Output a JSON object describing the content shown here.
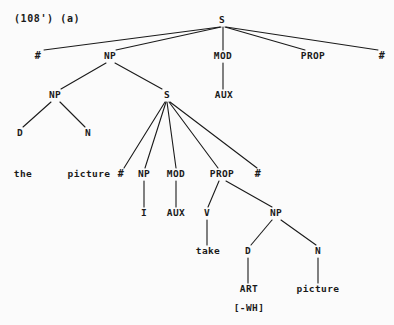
{
  "figure": {
    "caption": "(108') (a)",
    "caption_x": 14,
    "caption_y": 14,
    "background_color": "#fbfbfb",
    "ink_color": "#1a1a1a",
    "width": 394,
    "height": 325
  },
  "nodes": [
    {
      "id": "S0",
      "label": "S",
      "x": 222,
      "y": 20,
      "kind": "nonterminal"
    },
    {
      "id": "HASH_L",
      "label": "#",
      "x": 38,
      "y": 56,
      "kind": "boundary"
    },
    {
      "id": "NP1",
      "label": "NP",
      "x": 110,
      "y": 56,
      "kind": "nonterminal"
    },
    {
      "id": "MOD1",
      "label": "MOD",
      "x": 223,
      "y": 56,
      "kind": "nonterminal"
    },
    {
      "id": "PROP1",
      "label": "PROP",
      "x": 313,
      "y": 56,
      "kind": "nonterminal"
    },
    {
      "id": "HASH_R",
      "label": "#",
      "x": 382,
      "y": 56,
      "kind": "boundary"
    },
    {
      "id": "NP2",
      "label": "NP",
      "x": 55,
      "y": 95,
      "kind": "nonterminal"
    },
    {
      "id": "S1",
      "label": "S",
      "x": 167,
      "y": 95,
      "kind": "nonterminal"
    },
    {
      "id": "AUX1",
      "label": "AUX",
      "x": 224,
      "y": 95,
      "kind": "nonterminal"
    },
    {
      "id": "D1",
      "label": "D",
      "x": 20,
      "y": 133,
      "kind": "nonterminal"
    },
    {
      "id": "N1",
      "label": "N",
      "x": 88,
      "y": 133,
      "kind": "nonterminal"
    },
    {
      "id": "THE",
      "label": "the",
      "x": 23,
      "y": 174,
      "kind": "terminal"
    },
    {
      "id": "PICTURE1",
      "label": "picture",
      "x": 89,
      "y": 174,
      "kind": "terminal"
    },
    {
      "id": "HASH_L2",
      "label": "#",
      "x": 121,
      "y": 174,
      "kind": "boundary"
    },
    {
      "id": "NP3",
      "label": "NP",
      "x": 144,
      "y": 174,
      "kind": "nonterminal"
    },
    {
      "id": "MOD2",
      "label": "MOD",
      "x": 176,
      "y": 174,
      "kind": "nonterminal"
    },
    {
      "id": "PROP2",
      "label": "PROP",
      "x": 222,
      "y": 174,
      "kind": "nonterminal"
    },
    {
      "id": "HASH_R2",
      "label": "#",
      "x": 258,
      "y": 174,
      "kind": "boundary"
    },
    {
      "id": "I1",
      "label": "I",
      "x": 144,
      "y": 213,
      "kind": "nonterminal"
    },
    {
      "id": "AUX2",
      "label": "AUX",
      "x": 176,
      "y": 213,
      "kind": "nonterminal"
    },
    {
      "id": "V1",
      "label": "V",
      "x": 207,
      "y": 213,
      "kind": "nonterminal"
    },
    {
      "id": "NP4",
      "label": "NP",
      "x": 276,
      "y": 213,
      "kind": "nonterminal"
    },
    {
      "id": "TAKE",
      "label": "take",
      "x": 208,
      "y": 251,
      "kind": "terminal"
    },
    {
      "id": "D2",
      "label": "D",
      "x": 248,
      "y": 251,
      "kind": "nonterminal"
    },
    {
      "id": "N2",
      "label": "N",
      "x": 318,
      "y": 251,
      "kind": "nonterminal"
    },
    {
      "id": "ART",
      "label": "ART",
      "x": 249,
      "y": 289,
      "kind": "terminal"
    },
    {
      "id": "PICTURE2",
      "label": "picture",
      "x": 318,
      "y": 289,
      "kind": "terminal"
    },
    {
      "id": "WH",
      "label": "[-WH]",
      "x": 249,
      "y": 308,
      "kind": "feature"
    }
  ],
  "edges": [
    {
      "from": "S0",
      "to": "HASH_L",
      "x1": 220,
      "y1": 27,
      "x2": 44,
      "y2": 50
    },
    {
      "from": "S0",
      "to": "NP1",
      "x1": 221,
      "y1": 27,
      "x2": 116,
      "y2": 50
    },
    {
      "from": "S0",
      "to": "MOD1",
      "x1": 223,
      "y1": 27,
      "x2": 223,
      "y2": 50
    },
    {
      "from": "S0",
      "to": "PROP1",
      "x1": 225,
      "y1": 27,
      "x2": 305,
      "y2": 50
    },
    {
      "from": "S0",
      "to": "HASH_R",
      "x1": 226,
      "y1": 27,
      "x2": 378,
      "y2": 50
    },
    {
      "from": "NP1",
      "to": "NP2",
      "x1": 106,
      "y1": 63,
      "x2": 61,
      "y2": 89
    },
    {
      "from": "NP1",
      "to": "S1",
      "x1": 115,
      "y1": 63,
      "x2": 162,
      "y2": 89
    },
    {
      "from": "MOD1",
      "to": "AUX1",
      "x1": 223,
      "y1": 63,
      "x2": 223,
      "y2": 89
    },
    {
      "from": "NP2",
      "to": "D1",
      "x1": 51,
      "y1": 102,
      "x2": 23,
      "y2": 127
    },
    {
      "from": "NP2",
      "to": "N1",
      "x1": 60,
      "y1": 102,
      "x2": 85,
      "y2": 127
    },
    {
      "from": "D1",
      "to": "THE",
      "x1": 20,
      "y1": 140,
      "x2": 20,
      "y2": 140
    },
    {
      "from": "N1",
      "to": "PICTURE1",
      "x1": 88,
      "y1": 140,
      "x2": 88,
      "y2": 140
    },
    {
      "from": "S1",
      "to": "HASH_L2",
      "x1": 165,
      "y1": 102,
      "x2": 124,
      "y2": 168
    },
    {
      "from": "S1",
      "to": "NP3",
      "x1": 166,
      "y1": 102,
      "x2": 145,
      "y2": 168
    },
    {
      "from": "S1",
      "to": "MOD2",
      "x1": 167,
      "y1": 102,
      "x2": 176,
      "y2": 168
    },
    {
      "from": "S1",
      "to": "PROP2",
      "x1": 169,
      "y1": 102,
      "x2": 218,
      "y2": 168
    },
    {
      "from": "S1",
      "to": "HASH_R2",
      "x1": 170,
      "y1": 102,
      "x2": 257,
      "y2": 168
    },
    {
      "from": "NP3",
      "to": "I1",
      "x1": 144,
      "y1": 181,
      "x2": 144,
      "y2": 207
    },
    {
      "from": "MOD2",
      "to": "AUX2",
      "x1": 176,
      "y1": 181,
      "x2": 176,
      "y2": 207
    },
    {
      "from": "PROP2",
      "to": "V1",
      "x1": 219,
      "y1": 181,
      "x2": 208,
      "y2": 207
    },
    {
      "from": "PROP2",
      "to": "NP4",
      "x1": 226,
      "y1": 181,
      "x2": 272,
      "y2": 207
    },
    {
      "from": "V1",
      "to": "TAKE",
      "x1": 207,
      "y1": 220,
      "x2": 207,
      "y2": 245
    },
    {
      "from": "NP4",
      "to": "D2",
      "x1": 272,
      "y1": 220,
      "x2": 251,
      "y2": 245
    },
    {
      "from": "NP4",
      "to": "N2",
      "x1": 281,
      "y1": 220,
      "x2": 316,
      "y2": 245
    },
    {
      "from": "D2",
      "to": "ART",
      "x1": 248,
      "y1": 258,
      "x2": 248,
      "y2": 283
    },
    {
      "from": "N2",
      "to": "PICTURE2",
      "x1": 318,
      "y1": 258,
      "x2": 318,
      "y2": 283
    }
  ]
}
